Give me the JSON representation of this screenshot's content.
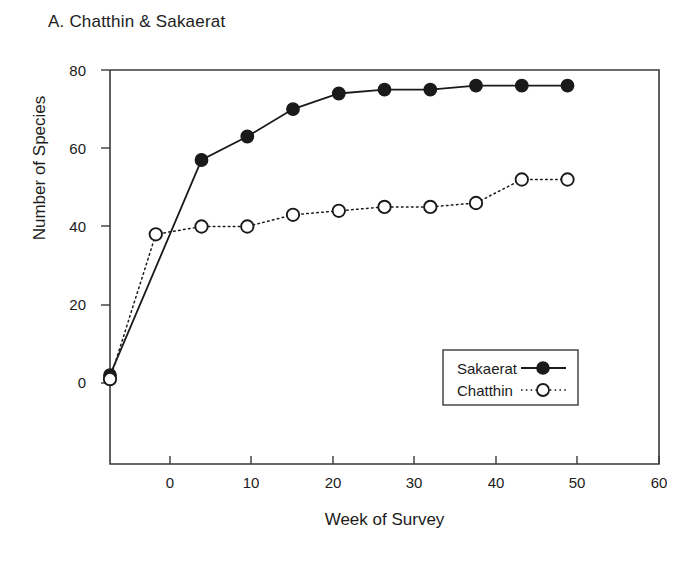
{
  "figure": {
    "panel_label": "A. Chatthin & Sakaerat"
  },
  "chart_data": {
    "type": "line",
    "title": "A. Chatthin & Sakaerat",
    "xlabel": "Week of Survey",
    "ylabel": "Number of Species",
    "xlim": [
      0,
      60
    ],
    "ylim": [
      0,
      80
    ],
    "xticks": [
      0,
      10,
      20,
      30,
      40,
      50,
      60
    ],
    "yticks": [
      0,
      20,
      40,
      60,
      80
    ],
    "xtick_labels": [
      "0",
      "10",
      "20",
      "30",
      "40",
      "50",
      "60"
    ],
    "ytick_labels": [
      "0",
      "20",
      "40",
      "60",
      "80"
    ],
    "grid": false,
    "legend_position": "center-right",
    "x": [
      0,
      5,
      10,
      15,
      20,
      25,
      30,
      35,
      40,
      45,
      50
    ],
    "series": [
      {
        "name": "Sakaerat",
        "marker": "filled-circle",
        "linestyle": "solid",
        "color": "#1a1a1a",
        "values": [
          2,
          null,
          57,
          63,
          70,
          74,
          75,
          75,
          76,
          76,
          76
        ]
      },
      {
        "name": "Chatthin",
        "marker": "open-circle",
        "linestyle": "dotted",
        "color": "#1a1a1a",
        "values": [
          1,
          38,
          40,
          40,
          43,
          44,
          45,
          45,
          46,
          52,
          52
        ]
      }
    ],
    "legend": [
      {
        "label": "Sakaerat",
        "marker": "filled-circle",
        "linestyle": "solid"
      },
      {
        "label": "Chatthin",
        "marker": "open-circle",
        "linestyle": "dotted"
      }
    ]
  },
  "axis_labels": {
    "y": "Number of Species",
    "x": "Week of Survey"
  }
}
